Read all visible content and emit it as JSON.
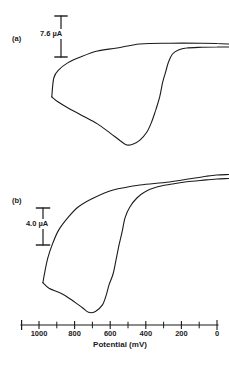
{
  "figure": {
    "background_color": "#ffffff",
    "ink_color": "#1b1b1b",
    "panels": [
      {
        "id": "a",
        "label": "(a)",
        "scale_bar": {
          "label": "7.6 µA",
          "value_uA": 7.6
        }
      },
      {
        "id": "b",
        "label": "(b)",
        "scale_bar": {
          "label": "4.0 µA",
          "value_uA": 4.0
        }
      }
    ],
    "x_axis": {
      "title": "Potential (mV)",
      "direction": "values decrease left-to-right",
      "labeled_ticks": [
        {
          "label": "1000",
          "value": 1000
        },
        {
          "label": "800",
          "value": 800
        },
        {
          "label": "600",
          "value": 600
        },
        {
          "label": "400",
          "value": 400
        },
        {
          "label": "200",
          "value": 200
        },
        {
          "label": "0",
          "value": 0
        }
      ],
      "minor_tick_values": [
        900,
        700,
        500,
        300,
        100
      ]
    }
  },
  "chart_data": [
    {
      "type": "line",
      "panel": "a",
      "title": "(a)",
      "xlabel": "Potential (mV)",
      "x_range_mV": [
        1000,
        0
      ],
      "current_scale_bar_uA": 7.6,
      "legend": "none",
      "grid": false,
      "series": [
        {
          "name": "forward_scan",
          "points": [
            [
              -65,
              0.55
            ],
            [
              0,
              0.55
            ],
            [
              83,
              0.6
            ],
            [
              172,
              0.74
            ],
            [
              217,
              1.1
            ],
            [
              250,
              1.85
            ],
            [
              272,
              3.3
            ],
            [
              289,
              5.2
            ],
            [
              306,
              7.2
            ],
            [
              322,
              9.8
            ],
            [
              344,
              12.2
            ],
            [
              367,
              14.4
            ],
            [
              394,
              16.3
            ],
            [
              433,
              17.8
            ],
            [
              470,
              18.5
            ],
            [
              506,
              18.7
            ],
            [
              544,
              17.9
            ],
            [
              600,
              16.5
            ],
            [
              672,
              14.8
            ],
            [
              767,
              13.1
            ],
            [
              839,
              11.8
            ],
            [
              894,
              10.7
            ],
            [
              928,
              9.8
            ]
          ]
        },
        {
          "name": "reverse_scan",
          "points": [
            [
              928,
              9.8
            ],
            [
              917,
              6.3
            ],
            [
              889,
              4.8
            ],
            [
              839,
              3.5
            ],
            [
              767,
              2.4
            ],
            [
              672,
              1.3
            ],
            [
              561,
              0.74
            ],
            [
              433,
              0.0
            ],
            [
              267,
              -0.15
            ],
            [
              83,
              -0.15
            ],
            [
              0,
              -0.1
            ],
            [
              -65,
              0.0
            ]
          ]
        }
      ]
    },
    {
      "type": "line",
      "panel": "b",
      "title": "(b)",
      "xlabel": "Potential (mV)",
      "x_range_mV": [
        1000,
        0
      ],
      "current_scale_bar_uA": 4.0,
      "legend": "none",
      "grid": false,
      "series": [
        {
          "name": "forward_scan",
          "points": [
            [
              -65,
              -0.05
            ],
            [
              0,
              0.0
            ],
            [
              61,
              0.1
            ],
            [
              170,
              0.3
            ],
            [
              250,
              0.54
            ],
            [
              339,
              0.86
            ],
            [
              406,
              1.4
            ],
            [
              450,
              2.05
            ],
            [
              489,
              3.0
            ],
            [
              517,
              4.2
            ],
            [
              533,
              5.7
            ],
            [
              550,
              7.1
            ],
            [
              567,
              8.7
            ],
            [
              583,
              10.2
            ],
            [
              606,
              11.4
            ],
            [
              622,
              12.5
            ],
            [
              644,
              13.6
            ],
            [
              683,
              14.3
            ],
            [
              722,
              14.4
            ],
            [
              756,
              13.9
            ],
            [
              806,
              13.2
            ],
            [
              861,
              12.5
            ],
            [
              894,
              12.2
            ],
            [
              944,
              11.8
            ],
            [
              978,
              11.2
            ]
          ]
        },
        {
          "name": "reverse_scan",
          "points": [
            [
              978,
              11.2
            ],
            [
              967,
              10.0
            ],
            [
              950,
              8.5
            ],
            [
              922,
              6.9
            ],
            [
              889,
              5.5
            ],
            [
              839,
              4.2
            ],
            [
              778,
              3.0
            ],
            [
              694,
              2.05
            ],
            [
              583,
              1.19
            ],
            [
              433,
              0.65
            ],
            [
              267,
              0.32
            ],
            [
              61,
              -0.29
            ],
            [
              0,
              -0.43
            ],
            [
              -65,
              -0.49
            ]
          ]
        }
      ]
    }
  ]
}
